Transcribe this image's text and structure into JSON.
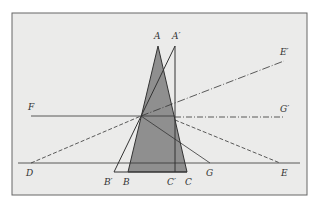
{
  "figure": {
    "width": 317,
    "height": 211,
    "frame": {
      "x": 12,
      "y": 13,
      "w": 295,
      "h": 182,
      "fill": "#ebebea",
      "stroke": "#666666"
    },
    "colors": {
      "line": "#333333",
      "shade": "#8f8f8f"
    },
    "points": {
      "A": [
        158,
        46
      ],
      "A_prime": [
        175,
        46
      ],
      "B_prime": [
        114,
        172
      ],
      "B": [
        128,
        172
      ],
      "C_prime": [
        174,
        172
      ],
      "C": [
        187,
        172
      ],
      "D": [
        31,
        163
      ],
      "E": [
        280,
        163
      ],
      "E_prime": [
        284,
        61
      ],
      "G_prime": [
        284,
        117
      ],
      "F_start": [
        31,
        116
      ],
      "G": [
        210,
        163
      ],
      "O": [
        141,
        116
      ]
    },
    "labels": [
      {
        "id": "A",
        "text": "A",
        "x": 154,
        "y": 39
      },
      {
        "id": "A_prime",
        "text": "A′",
        "x": 172,
        "y": 39
      },
      {
        "id": "E_prime",
        "text": "E′",
        "x": 282,
        "y": 55
      },
      {
        "id": "F",
        "text": "F",
        "x": 28,
        "y": 110
      },
      {
        "id": "G_prime",
        "text": "G′",
        "x": 281,
        "y": 112
      },
      {
        "id": "D",
        "text": "D",
        "x": 26,
        "y": 176
      },
      {
        "id": "B_prime",
        "text": "B′",
        "x": 104,
        "y": 185
      },
      {
        "id": "B",
        "text": "B",
        "x": 123,
        "y": 185
      },
      {
        "id": "C_prime",
        "text": "C′",
        "x": 167,
        "y": 185
      },
      {
        "id": "C",
        "text": "C",
        "x": 185,
        "y": 185
      },
      {
        "id": "G",
        "text": "G",
        "x": 206,
        "y": 176
      },
      {
        "id": "E",
        "text": "E",
        "x": 281,
        "y": 176
      }
    ]
  }
}
